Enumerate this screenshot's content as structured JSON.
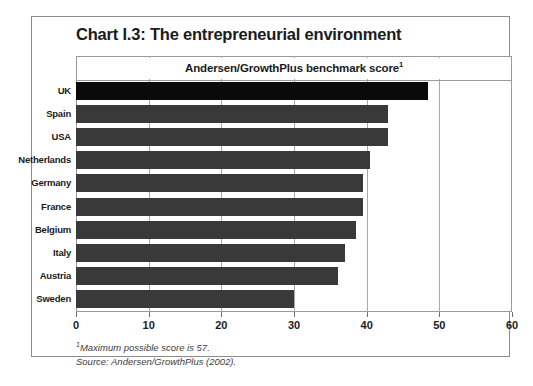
{
  "figure": {
    "title": "Chart I.3: The entrepreneurial environment",
    "subtitle": "Andersen/GrowthPlus benchmark score",
    "subtitle_superscript": "1",
    "footnote_marker": "1",
    "footnote": "Maximum possible score is 57.",
    "source": "Source: Andersen/GrowthPlus (2002).",
    "colors": {
      "bar": "#393939",
      "bar_highlight": "#0a0a0a",
      "frame": "#8c8c8c",
      "gridline": "#a9a9a9",
      "text": "#1b1b1b",
      "footnote_text": "#3d3d3d",
      "background": "#ffffff"
    }
  },
  "chart_data": {
    "type": "bar",
    "orientation": "horizontal",
    "title": "Chart I.3: The entrepreneurial environment",
    "subtitle": "Andersen/GrowthPlus benchmark score",
    "xlabel": "",
    "ylabel": "",
    "xlim": [
      0,
      60
    ],
    "xticks": [
      0,
      10,
      20,
      30,
      40,
      50,
      60
    ],
    "xticklabels": [
      "0",
      "10",
      "20",
      "30",
      "40",
      "50",
      "60"
    ],
    "grid": true,
    "legend": "none",
    "categories": [
      "UK",
      "Spain",
      "USA",
      "Netherlands",
      "Germany",
      "France",
      "Belgium",
      "Italy",
      "Austria",
      "Sweden"
    ],
    "values": [
      48.5,
      43,
      43,
      40.5,
      39.5,
      39.5,
      38.5,
      37,
      36,
      30
    ],
    "highlight_category": "UK",
    "annotations": [
      "Maximum possible score is 57.",
      "Source: Andersen/GrowthPlus (2002)."
    ]
  }
}
